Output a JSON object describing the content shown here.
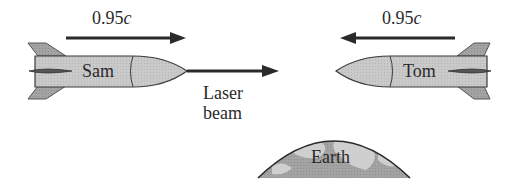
{
  "diagram": {
    "sam": {
      "name": "Sam",
      "velocity_label": "0.95",
      "velocity_unit": "c",
      "direction": "right"
    },
    "tom": {
      "name": "Tom",
      "velocity_label": "0.95",
      "velocity_unit": "c",
      "direction": "left"
    },
    "laser": {
      "line1": "Laser",
      "line2": "beam"
    },
    "earth": {
      "label": "Earth"
    },
    "colors": {
      "rocket_body": "#c8c8c8",
      "rocket_fin": "#9a9a9a",
      "outline": "#3a3a3a",
      "arrow": "#2a2a2a",
      "earth_fill": "#a8a8a8",
      "earth_land": "#cfcfcf",
      "background": "#ffffff"
    }
  }
}
